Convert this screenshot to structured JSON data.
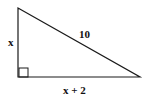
{
  "diagram": {
    "type": "right-triangle",
    "colors": {
      "stroke": "#1a1a1a",
      "background": "#ffffff",
      "text": "#111111"
    },
    "vertices": {
      "top": [
        18,
        8
      ],
      "right_angle": [
        18,
        77
      ],
      "right": [
        140,
        77
      ]
    },
    "labels": {
      "vertical_leg": "x",
      "hypotenuse": "10",
      "horizontal_leg": "x + 2"
    },
    "right_angle_marker": true
  }
}
